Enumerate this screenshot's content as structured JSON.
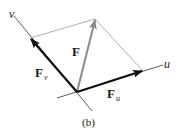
{
  "figure": {
    "caption": "(b)",
    "axes": {
      "u": {
        "label": "u"
      },
      "v": {
        "label": "v"
      }
    },
    "vectors": {
      "resultant": {
        "label": "F",
        "color": "#8c8c8c"
      },
      "component_u": {
        "label": "F",
        "subscript": "u",
        "color": "#111111"
      },
      "component_v": {
        "label": "F",
        "subscript": "v",
        "color": "#111111"
      }
    },
    "construction_line_color": "#9a9a9a",
    "axis_color": "#333333"
  }
}
